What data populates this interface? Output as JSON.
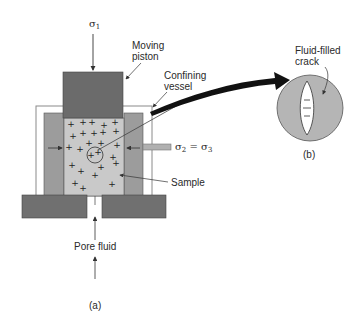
{
  "figure": {
    "panel_a": {
      "caption": "(a)",
      "sigma1": {
        "symbol": "σ",
        "subscript": "1"
      },
      "sigma23": {
        "left_symbol": "σ",
        "left_sub": "2",
        "eq": " = ",
        "right_symbol": "σ",
        "right_sub": "3"
      },
      "labels": {
        "moving_piston_line1": "Moving",
        "moving_piston_line2": "piston",
        "confining_vessel_line1": "Confining",
        "confining_vessel_line2": "vessel",
        "sample": "Sample",
        "pore_fluid": "Pore fluid"
      }
    },
    "panel_b": {
      "caption": "(b)",
      "labels": {
        "crack_line1": "Fluid-filled",
        "crack_line2": "crack"
      }
    },
    "colors": {
      "piston": "#6b6b6b",
      "base": "#707070",
      "walls": "#9c9c9c",
      "sample": "#c9c9c9",
      "circle_b": "#b5b5b5",
      "vessel_border": "#8a8a8a",
      "arrow": "#111111"
    }
  }
}
